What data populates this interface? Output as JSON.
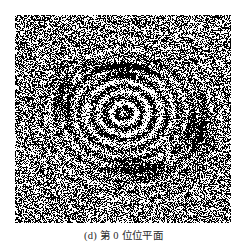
{
  "figure": {
    "caption_label": "(d)",
    "caption_text": "第 0 位位平面",
    "caption_full": "(d) 第 0 位位平面",
    "panel_name": "bit-plane-image",
    "background_color": "#ffffff",
    "ink_color": "#000000",
    "paper_color": "#ffffff"
  },
  "chart_data": {
    "type": "heatmap",
    "title": "(d) 第 0 位位平面",
    "xlabel": "",
    "ylabel": "",
    "bit_plane_index": 0,
    "value_levels": [
      0,
      1
    ],
    "level_colors": [
      "#ffffff",
      "#000000"
    ],
    "grid": false,
    "legend": null,
    "panel_pixels": {
      "width": 216,
      "height": 208
    },
    "noise": {
      "model": "bernoulli-binary",
      "base_black_probability": 0.5,
      "cell_size_px": 1
    },
    "fringe_structure": {
      "pattern": "concentric-ellipses",
      "center_x_frac": 0.5,
      "center_y_frac": 0.47,
      "radius_x_frac": 0.52,
      "radius_y_frac": 0.46,
      "ring_count": 9,
      "ring_spacing_frac": 0.058,
      "contrast_amplitude": 0.42,
      "modulation_falloff": 0.55,
      "bright_band_centers_frac": [
        0.07,
        0.16,
        0.25,
        0.34,
        0.44,
        0.55,
        0.67,
        0.8,
        0.93
      ],
      "dark_band_emphasis_regions": [
        {
          "name": "upper-core-band",
          "cx_frac": 0.5,
          "cy_frac": 0.26,
          "w_frac": 0.4,
          "h_frac": 0.1,
          "strength": 0.85
        },
        {
          "name": "lower-core-band",
          "cx_frac": 0.57,
          "cy_frac": 0.74,
          "w_frac": 0.36,
          "h_frac": 0.11,
          "strength": 0.8
        },
        {
          "name": "right-vertical-streaks",
          "cx_frac": 0.85,
          "cy_frac": 0.55,
          "w_frac": 0.16,
          "h_frac": 0.34,
          "strength": 0.7
        },
        {
          "name": "left-arc",
          "cx_frac": 0.22,
          "cy_frac": 0.4,
          "w_frac": 0.14,
          "h_frac": 0.3,
          "strength": 0.55
        }
      ]
    }
  }
}
